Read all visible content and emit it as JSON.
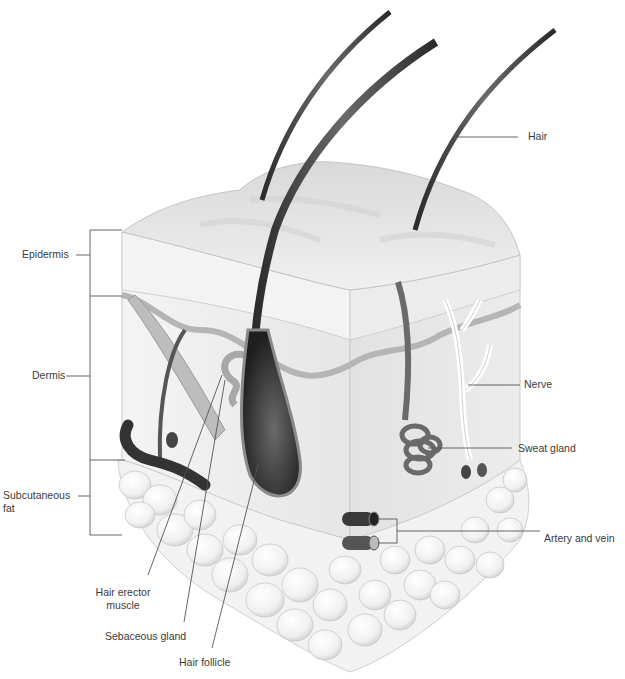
{
  "labels": {
    "hair": "Hair",
    "epidermis": "Epidermis",
    "dermis": "Dermis",
    "subcutaneous_line1": "Subcutaneous",
    "subcutaneous_line2": "fat",
    "nerve": "Nerve",
    "sweat_gland": "Sweat gland",
    "artery_vein": "Artery and vein",
    "hair_erector_line1": "Hair erector",
    "hair_erector_line2": "muscle",
    "sebaceous_gland": "Sebaceous gland",
    "hair_follicle": "Hair follicle"
  },
  "colors": {
    "background": "#ffffff",
    "label_text": "#3a3a3a",
    "leader_line": "#555555",
    "epidermis_top": "#e4e4e4",
    "epidermis_side": "#efefef",
    "basal_layer": "#b8b8b8",
    "dermis": "#ebebeb",
    "fat": "#f6f6f6",
    "hair": "#3a3a3a"
  }
}
